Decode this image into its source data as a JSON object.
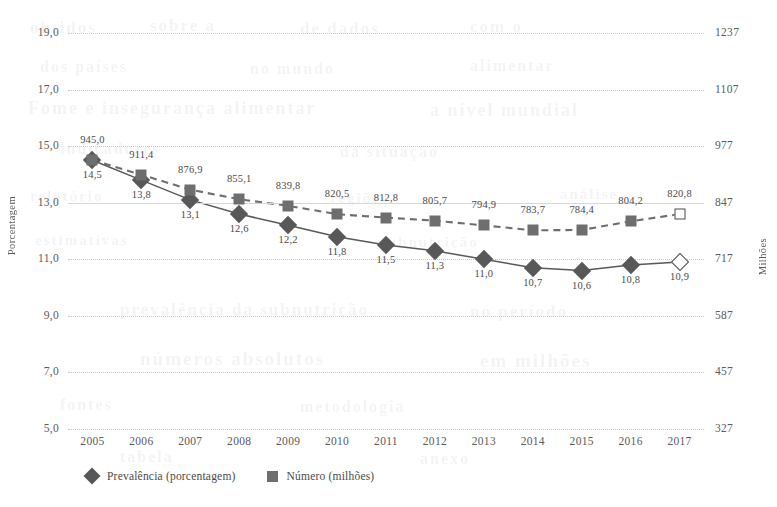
{
  "chart_data": {
    "type": "line",
    "title": "",
    "subtitle": "",
    "categories": [
      "2005",
      "2006",
      "2007",
      "2008",
      "2009",
      "2010",
      "2011",
      "2012",
      "2013",
      "2014",
      "2015",
      "2016",
      "2017"
    ],
    "xlabel": "",
    "series": [
      {
        "name": "Prevalência (porcentagem)",
        "axis": "left",
        "marker": "diamond",
        "linestyle": "solid",
        "color": "#585858",
        "values": [
          14.5,
          13.8,
          13.1,
          12.6,
          12.2,
          11.8,
          11.5,
          11.3,
          11.0,
          10.7,
          10.6,
          10.8,
          10.9
        ],
        "labels": [
          "14,5",
          "13,8",
          "13,1",
          "12,6",
          "12,2",
          "11,8",
          "11,5",
          "11,3",
          "11,0",
          "10,7",
          "10,6",
          "10,8",
          "10,9"
        ],
        "projected_index": 12
      },
      {
        "name": "Número (milhões)",
        "axis": "right",
        "marker": "square",
        "linestyle": "dashed",
        "color": "#6e6e6e",
        "values": [
          945.0,
          911.4,
          876.9,
          855.1,
          839.8,
          820.5,
          812.8,
          805.7,
          794.9,
          783.7,
          784.4,
          804.2,
          820.8
        ],
        "labels": [
          "945,0",
          "911,4",
          "876,9",
          "855,1",
          "839,8",
          "820,5",
          "812,8",
          "805,7",
          "794,9",
          "783,7",
          "784,4",
          "804,2",
          "820,8"
        ],
        "projected_index": 12
      }
    ],
    "left_axis": {
      "label": "Porcentagem",
      "ticks": [
        "5,0",
        "7,0",
        "9,0",
        "11,0",
        "13,0",
        "15,0",
        "17,0",
        "19,0"
      ],
      "values": [
        5,
        7,
        9,
        11,
        13,
        15,
        17,
        19
      ],
      "ylim": [
        5,
        19
      ]
    },
    "right_axis": {
      "label": "Milhões",
      "ticks": [
        "327",
        "457",
        "587",
        "717",
        "847",
        "977",
        "1107",
        "1237"
      ],
      "values": [
        327,
        457,
        587,
        717,
        847,
        977,
        1107,
        1237
      ],
      "ylim": [
        327,
        1237
      ]
    },
    "grid": true,
    "legend_position": "bottom-left",
    "legend": [
      "Prevalência (porcentagem)",
      "Número (milhões)"
    ]
  },
  "legend": {
    "items": [
      {
        "label": "Prevalência (porcentagem)",
        "marker": "diamond-icon"
      },
      {
        "label": "Número (milhões)",
        "marker": "square-icon"
      }
    ]
  },
  "background_ghost_text": [
    "obtidos",
    "sobre a",
    "de dados",
    "com o",
    "dos países",
    "no mundo",
    "alimentar",
    "Fome e insegurança alimentar",
    "a nível mundial"
  ]
}
